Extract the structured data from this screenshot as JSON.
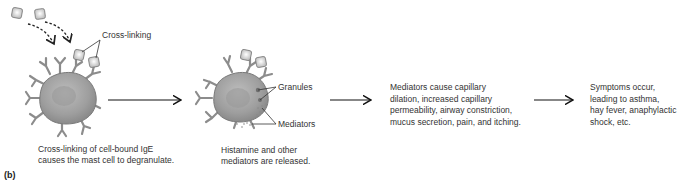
{
  "figure": {
    "panel_label": "(b)",
    "stage1": {
      "label_crosslinking": "Cross-linking",
      "caption_line1": "Cross-linking of cell-bound IgE",
      "caption_line2": "causes the mast cell to degranulate."
    },
    "stage2": {
      "label_granules": "Granules",
      "label_mediators": "Mediators",
      "caption_line1": "Histamine and other",
      "caption_line2": "mediators are released."
    },
    "stage3": {
      "lines": [
        "Mediators cause capillary",
        "dilation, increased capillary",
        "permeability, airway constriction,",
        "mucus secretion, pain, and itching."
      ]
    },
    "stage4": {
      "lines": [
        "Symptoms occur,",
        "leading to asthma,",
        "hay fever, anaphylactic",
        "shock, etc."
      ]
    },
    "colors": {
      "cell_fill": "#a9a9a9",
      "cell_edge": "#7a7a7a",
      "antibody": "#8c8c8c",
      "antigen_fill": "#e6e6e6",
      "arrow": "#111111",
      "text": "#333333"
    }
  }
}
